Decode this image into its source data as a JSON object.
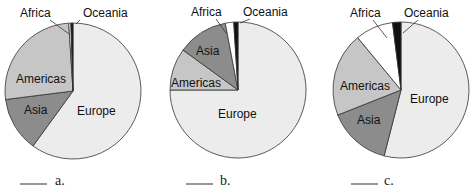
{
  "colors": {
    "Europe": "#ececec",
    "Asia": "#8c8c8c",
    "Americas": "#c6c6c6",
    "Africa": "#ffffff",
    "Oceania": "#111111",
    "stroke": "#333333"
  },
  "chart_data": [
    {
      "type": "pie",
      "title": "",
      "caption": "a.",
      "categories": [
        "Europe",
        "Asia",
        "Americas",
        "Africa",
        "Oceania"
      ],
      "values": [
        60,
        13,
        26,
        0.5,
        0.5
      ],
      "center": [
        73,
        91
      ],
      "radius": 68
    },
    {
      "type": "pie",
      "title": "",
      "caption": "b.",
      "categories": [
        "Europe",
        "Americas",
        "Asia",
        "Africa",
        "Oceania"
      ],
      "values": [
        75,
        10,
        12,
        2,
        1
      ],
      "center": [
        238,
        90
      ],
      "radius": 68
    },
    {
      "type": "pie",
      "title": "",
      "caption": "c.",
      "categories": [
        "Europe",
        "Asia",
        "Americas",
        "Africa",
        "Oceania"
      ],
      "values": [
        54,
        15,
        20,
        9,
        2
      ],
      "center": [
        401,
        90
      ],
      "radius": 68
    }
  ],
  "labels": {
    "a": [
      {
        "text": "Africa",
        "x": 20,
        "y": 17
      },
      {
        "text": "Oceania",
        "x": 83,
        "y": 17
      },
      {
        "text": "Americas",
        "x": 16,
        "y": 83
      },
      {
        "text": "Asia",
        "x": 24,
        "y": 114
      },
      {
        "text": "Europe",
        "x": 77,
        "y": 115
      }
    ],
    "b": [
      {
        "text": "Africa",
        "x": 191,
        "y": 16
      },
      {
        "text": "Oceania",
        "x": 243,
        "y": 16
      },
      {
        "text": "Asia",
        "x": 196,
        "y": 55
      },
      {
        "text": "Americas",
        "x": 171,
        "y": 87
      },
      {
        "text": "Europe",
        "x": 218,
        "y": 118
      }
    ],
    "c": [
      {
        "text": "Africa",
        "x": 350,
        "y": 17
      },
      {
        "text": "Oceania",
        "x": 404,
        "y": 17
      },
      {
        "text": "Americas",
        "x": 340,
        "y": 90
      },
      {
        "text": "Asia",
        "x": 357,
        "y": 124
      },
      {
        "text": "Europe",
        "x": 410,
        "y": 103
      }
    ]
  },
  "captions": [
    {
      "text": "a.",
      "x": 55,
      "y": 187,
      "line": [
        20,
        47
      ]
    },
    {
      "text": "b.",
      "x": 220,
      "y": 187,
      "line": [
        186,
        213
      ]
    },
    {
      "text": "c.",
      "x": 384,
      "y": 187,
      "line": [
        351,
        378
      ]
    }
  ]
}
